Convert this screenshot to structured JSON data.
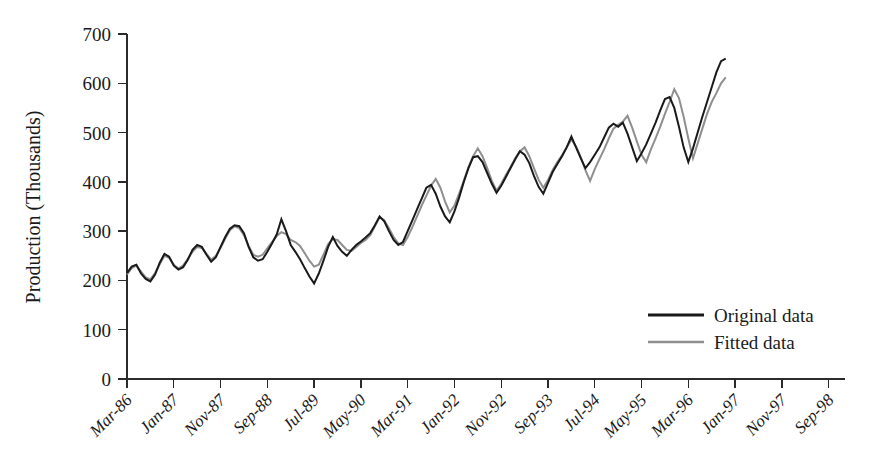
{
  "chart_data": {
    "type": "line",
    "title": "",
    "xlabel": "",
    "ylabel": "Production (Thousands)",
    "ylim": [
      0,
      700
    ],
    "yticks": [
      0,
      100,
      200,
      300,
      400,
      500,
      600,
      700
    ],
    "ytick_labels": [
      "0",
      "100",
      "200",
      "300",
      "400",
      "500",
      "600",
      "700"
    ],
    "grid": false,
    "legend_position": "bottom-right",
    "x_tick_labels": [
      "Mar-86",
      "Jan-87",
      "Nov-87",
      "Sep-88",
      "Jul-89",
      "May-90",
      "Mar-91",
      "Jan-92",
      "Nov-92",
      "Sep-93",
      "Jul-94",
      "May-95",
      "Mar-96",
      "Jan-97",
      "Nov-97",
      "Sep-98"
    ],
    "x_tick_step_months": 10,
    "x_start_label": "Mar-86",
    "x_count": 153,
    "colors": {
      "original": "#1a1a1a",
      "fitted": "#8f8f8f",
      "axis": "#2b2b2b",
      "background": "#ffffff"
    },
    "series": [
      {
        "name": "Original data",
        "color": "#1a1a1a",
        "values": [
          215,
          228,
          232,
          214,
          203,
          198,
          212,
          236,
          254,
          248,
          230,
          222,
          227,
          242,
          262,
          272,
          268,
          252,
          238,
          247,
          268,
          288,
          305,
          312,
          310,
          296,
          268,
          247,
          240,
          243,
          258,
          275,
          293,
          324,
          300,
          272,
          258,
          243,
          225,
          208,
          194,
          214,
          240,
          268,
          288,
          270,
          258,
          250,
          262,
          272,
          279,
          287,
          296,
          312,
          330,
          320,
          300,
          282,
          272,
          278,
          300,
          322,
          344,
          366,
          388,
          394,
          376,
          350,
          330,
          318,
          340,
          368,
          400,
          428,
          450,
          452,
          440,
          418,
          396,
          378,
          392,
          410,
          428,
          446,
          462,
          455,
          438,
          412,
          390,
          376,
          398,
          420,
          436,
          452,
          470,
          492,
          470,
          448,
          428,
          440,
          455,
          470,
          490,
          510,
          518,
          512,
          520,
          498,
          470,
          442,
          458,
          476,
          498,
          520,
          545,
          568,
          572,
          550,
          512,
          470,
          440,
          468,
          500,
          532,
          562,
          592,
          622,
          645,
          650
        ]
      },
      {
        "name": "Fitted data",
        "color": "#8f8f8f",
        "values": [
          212,
          225,
          230,
          218,
          206,
          202,
          215,
          233,
          250,
          246,
          232,
          224,
          230,
          244,
          258,
          268,
          266,
          254,
          242,
          250,
          266,
          285,
          302,
          310,
          306,
          292,
          270,
          252,
          248,
          252,
          265,
          278,
          290,
          298,
          294,
          282,
          278,
          270,
          255,
          240,
          228,
          232,
          252,
          274,
          284,
          282,
          272,
          262,
          260,
          268,
          276,
          282,
          292,
          310,
          328,
          322,
          306,
          288,
          275,
          272,
          288,
          308,
          330,
          352,
          372,
          392,
          406,
          388,
          360,
          338,
          352,
          376,
          402,
          430,
          452,
          468,
          452,
          428,
          402,
          382,
          396,
          414,
          430,
          448,
          462,
          470,
          452,
          428,
          404,
          388,
          404,
          424,
          440,
          454,
          470,
          486,
          472,
          450,
          424,
          402,
          426,
          446,
          466,
          488,
          508,
          516,
          522,
          534,
          510,
          482,
          455,
          440,
          466,
          488,
          512,
          538,
          562,
          588,
          570,
          532,
          488,
          448,
          478,
          508,
          538,
          562,
          580,
          600,
          612
        ]
      }
    ]
  },
  "legend": {
    "items": [
      {
        "label": "Original data",
        "color": "#1a1a1a"
      },
      {
        "label": "Fitted data",
        "color": "#8f8f8f"
      }
    ]
  }
}
